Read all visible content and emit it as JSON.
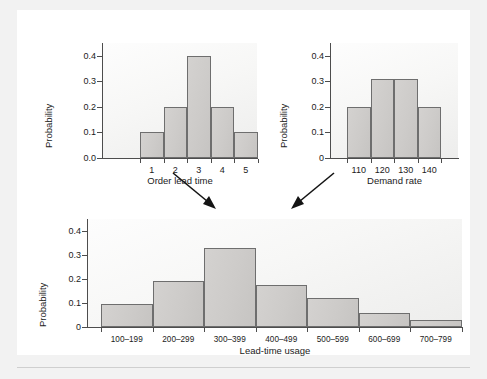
{
  "figure": {
    "background": "#ffffff",
    "page_background": "#f2f2f2",
    "bar_fill": "#cdcbc9",
    "bar_stroke": "#6e6e6e",
    "axis_color": "#4d4d4d"
  },
  "chart_data": [
    {
      "id": "order-lead-time",
      "type": "bar",
      "title": "",
      "xlabel": "Order lead time",
      "ylabel": "Probability",
      "categories": [
        "1",
        "2",
        "3",
        "4",
        "5"
      ],
      "values": [
        0.1,
        0.2,
        0.4,
        0.2,
        0.1
      ],
      "yticks": [
        "0.0",
        "0.1",
        "0.2",
        "0.3",
        "0.4"
      ],
      "ytickvals": [
        0.0,
        0.1,
        0.2,
        0.3,
        0.4
      ],
      "ylim": [
        0,
        0.45
      ],
      "grid": false,
      "legend": "none"
    },
    {
      "id": "demand-rate",
      "type": "bar",
      "title": "",
      "xlabel": "Demand rate",
      "ylabel": "Probability",
      "categories": [
        "110",
        "120",
        "130",
        "140"
      ],
      "values": [
        0.2,
        0.31,
        0.31,
        0.2
      ],
      "yticks": [
        "0",
        "0.1",
        "0.2",
        "0.3",
        "0.4"
      ],
      "ytickvals": [
        0.0,
        0.1,
        0.2,
        0.3,
        0.4
      ],
      "ylim": [
        0,
        0.45
      ],
      "grid": false,
      "legend": "none"
    },
    {
      "id": "lead-time-usage",
      "type": "bar",
      "title": "",
      "xlabel": "Lead-time usage",
      "ylabel": "Probability",
      "categories": [
        "100–199",
        "200–299",
        "300–399",
        "400–499",
        "500–599",
        "600–699",
        "700–799"
      ],
      "values": [
        0.095,
        0.19,
        0.33,
        0.175,
        0.12,
        0.06,
        0.03
      ],
      "yticks": [
        "0",
        "0.1",
        "0.2",
        "0.3",
        "0.4"
      ],
      "ytickvals": [
        0.0,
        0.1,
        0.2,
        0.3,
        0.4
      ],
      "ylim": [
        0,
        0.45
      ],
      "grid": false,
      "legend": "none"
    }
  ],
  "annotations": {
    "arrow_left": "arrow-from-order-lead-time-to-lead-time-usage",
    "arrow_right": "arrow-from-demand-rate-to-lead-time-usage"
  }
}
